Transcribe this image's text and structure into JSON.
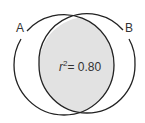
{
  "diagram": {
    "type": "venn",
    "sets": [
      {
        "label": "A"
      },
      {
        "label": "B"
      }
    ],
    "overlap": {
      "stat_var": "r",
      "stat_exp": "2",
      "stat_value": "= 0.80"
    },
    "colors": {
      "stroke": "#222222",
      "overlap_fill": "#e2e2e2",
      "background": "#ffffff"
    }
  }
}
